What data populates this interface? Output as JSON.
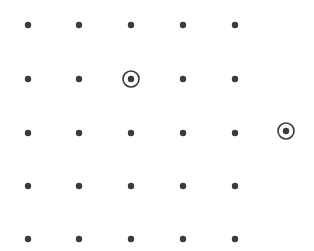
{
  "diagram": {
    "type": "dot-grid",
    "background": "#ffffff",
    "dot_color": "#3a3a3a",
    "dot_radius": 3.2,
    "ring_radius": 8,
    "ring_stroke": 1.6,
    "grid": {
      "rows": 5,
      "cols": 5,
      "x": [
        28,
        79,
        131,
        183,
        235
      ],
      "y": [
        25,
        79,
        133,
        186,
        239
      ]
    },
    "circled_points": [
      {
        "row": 2,
        "col": 3,
        "x": 131,
        "y": 79
      },
      {
        "row": 3,
        "col": 6,
        "x": 286,
        "y": 131
      }
    ]
  }
}
